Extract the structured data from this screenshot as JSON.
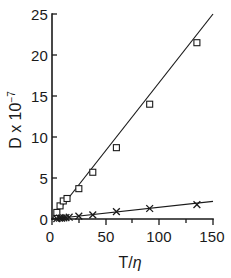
{
  "chart_data": {
    "type": "scatter",
    "title": "",
    "xlabel": "T/η",
    "ylabel": "D x 10⁻⁷",
    "xlim": [
      0,
      150
    ],
    "ylim": [
      0,
      25
    ],
    "xticks": [
      0,
      50,
      100,
      150
    ],
    "yticks": [
      0,
      5,
      10,
      15,
      20,
      25
    ],
    "xtick_labels": [
      "0",
      "50",
      "100",
      "150"
    ],
    "ytick_labels": [
      "0",
      "5",
      "10",
      "15",
      "20",
      "25"
    ],
    "grid": false,
    "legend": "none",
    "series": [
      {
        "name": "squares",
        "marker": "square",
        "fit_line": {
          "x": [
            0,
            150
          ],
          "y": [
            0,
            25.0
          ]
        },
        "x": [
          4.5,
          7.5,
          10.5,
          14.0,
          25.0,
          38.0,
          60.0,
          91.0,
          135.0
        ],
        "y": [
          0.8,
          1.6,
          2.2,
          2.5,
          3.7,
          5.7,
          8.7,
          14.0,
          21.5
        ]
      },
      {
        "name": "crosses",
        "marker": "cross",
        "fit_line": {
          "x": [
            0,
            150
          ],
          "y": [
            0,
            2.15
          ]
        },
        "x": [
          4.5,
          7.0,
          9.0,
          11.0,
          13.0,
          16.0,
          25.0,
          38.0,
          60.0,
          91.0,
          135.0
        ],
        "y": [
          0.05,
          0.1,
          0.12,
          0.15,
          0.18,
          0.22,
          0.35,
          0.5,
          0.9,
          1.28,
          1.75
        ]
      }
    ]
  },
  "axis": {
    "y_label_main": "D x 10",
    "y_label_exponent": "−7",
    "x_label_numerator": "T",
    "x_label_slash": "/",
    "x_label_denominator": "η"
  },
  "colors": {
    "ink": "#1a1a1a",
    "background": "#ffffff"
  }
}
